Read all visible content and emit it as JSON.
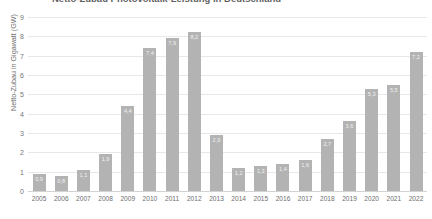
{
  "chart_data": {
    "type": "bar",
    "title": "Netto-Zubau Photovoltaik-Leistung in Deutschland",
    "xlabel": "",
    "ylabel": "Netto-Zubau in Gigawatt (GW)",
    "ylim": [
      0,
      9
    ],
    "yticks": [
      0,
      1,
      2,
      3,
      4,
      5,
      6,
      7,
      8,
      9
    ],
    "ytick_labels": [
      "0",
      "1",
      "2",
      "3",
      "4",
      "5",
      "6",
      "7",
      "8",
      "9"
    ],
    "grid": true,
    "legend": false,
    "bar_color": "#b3b3b3",
    "categories": [
      "2005",
      "2006",
      "2007",
      "2008",
      "2009",
      "2010",
      "2011",
      "2012",
      "2013",
      "2014",
      "2015",
      "2016",
      "2017",
      "2018",
      "2019",
      "2020",
      "2021",
      "2022"
    ],
    "values": [
      0.9,
      0.8,
      1.1,
      1.9,
      4.4,
      7.4,
      7.9,
      8.2,
      2.9,
      1.2,
      1.3,
      1.4,
      1.6,
      2.7,
      3.6,
      5.3,
      5.5,
      7.2
    ],
    "value_labels": [
      "0,9",
      "0,8",
      "1,1",
      "1,9",
      "4,4",
      "7,4",
      "7,9",
      "8,2",
      "2,9",
      "1,2",
      "1,3",
      "1,4",
      "1,6",
      "2,7",
      "3,6",
      "5,3",
      "5,5",
      "7,2"
    ]
  }
}
